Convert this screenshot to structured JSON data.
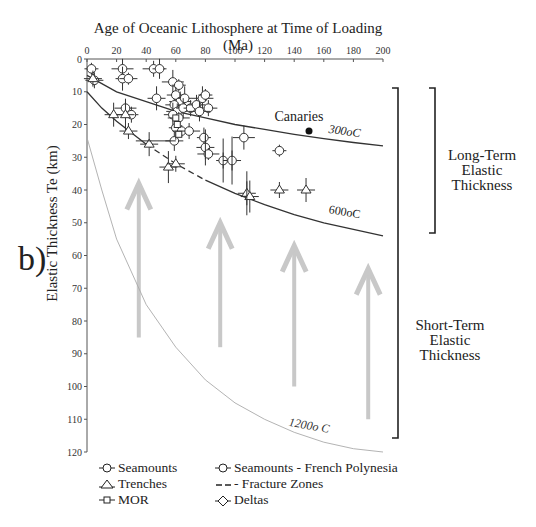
{
  "panel_label": "b)",
  "chart_data": {
    "type": "scatter",
    "title": "Age of Oceanic Lithosphere at Time of Loading (Ma)",
    "xlabel": "Age of Oceanic Lithosphere at Time of Loading (Ma)",
    "ylabel": "Elastic Thickness Te (km)",
    "xlim": [
      0,
      200
    ],
    "ylim": [
      0,
      120
    ],
    "y_inverted": true,
    "x_ticks": [
      0,
      20,
      40,
      60,
      80,
      100,
      120,
      140,
      160,
      180,
      200
    ],
    "y_ticks": [
      0,
      10,
      20,
      30,
      40,
      50,
      60,
      70,
      80,
      90,
      100,
      110,
      120
    ],
    "x_axis_position": "top",
    "grid": false,
    "isotherms": [
      {
        "label": "300oC",
        "points": [
          [
            0,
            5
          ],
          [
            20,
            10
          ],
          [
            40,
            13
          ],
          [
            60,
            16
          ],
          [
            80,
            18
          ],
          [
            100,
            20
          ],
          [
            120,
            21.5
          ],
          [
            140,
            23
          ],
          [
            160,
            24.3
          ],
          [
            180,
            25.5
          ],
          [
            200,
            26.5
          ]
        ]
      },
      {
        "label": "600oC",
        "points": [
          [
            0,
            10
          ],
          [
            10,
            15
          ],
          [
            20,
            19
          ],
          [
            40,
            26
          ],
          [
            60,
            32
          ],
          [
            80,
            37
          ],
          [
            100,
            41
          ],
          [
            120,
            44.5
          ],
          [
            140,
            47.5
          ],
          [
            160,
            50
          ],
          [
            180,
            52
          ],
          [
            200,
            54
          ]
        ]
      },
      {
        "label": "1200oC",
        "points": [
          [
            0,
            24
          ],
          [
            10,
            40
          ],
          [
            20,
            55
          ],
          [
            40,
            75
          ],
          [
            60,
            88
          ],
          [
            80,
            98
          ],
          [
            100,
            105
          ],
          [
            120,
            110
          ],
          [
            140,
            114
          ],
          [
            160,
            117
          ],
          [
            180,
            119
          ],
          [
            200,
            120
          ]
        ]
      }
    ],
    "series": [
      {
        "name": "Seamounts",
        "marker": "circle",
        "points": [
          {
            "x": 3,
            "y": 3
          },
          {
            "x": 5,
            "y": 6.5
          },
          {
            "x": 24,
            "y": 3
          },
          {
            "x": 24,
            "y": 6
          },
          {
            "x": 28,
            "y": 6
          },
          {
            "x": 45,
            "y": 3
          },
          {
            "x": 49,
            "y": 3
          },
          {
            "x": 47,
            "y": 12
          },
          {
            "x": 26,
            "y": 15
          },
          {
            "x": 30,
            "y": 17
          },
          {
            "x": 59,
            "y": 25
          },
          {
            "x": 58,
            "y": 7
          },
          {
            "x": 62,
            "y": 8
          },
          {
            "x": 60,
            "y": 11
          },
          {
            "x": 63,
            "y": 13
          },
          {
            "x": 66,
            "y": 12
          },
          {
            "x": 59,
            "y": 14
          },
          {
            "x": 61,
            "y": 16
          },
          {
            "x": 65,
            "y": 15
          },
          {
            "x": 58,
            "y": 17
          },
          {
            "x": 62,
            "y": 18
          },
          {
            "x": 70,
            "y": 15
          },
          {
            "x": 74,
            "y": 14
          },
          {
            "x": 78,
            "y": 12
          },
          {
            "x": 80,
            "y": 11
          },
          {
            "x": 82,
            "y": 15
          },
          {
            "x": 76,
            "y": 16
          },
          {
            "x": 60,
            "y": 21
          },
          {
            "x": 64,
            "y": 22
          },
          {
            "x": 69,
            "y": 22
          },
          {
            "x": 79,
            "y": 24
          },
          {
            "x": 80,
            "y": 27
          },
          {
            "x": 82,
            "y": 29
          },
          {
            "x": 92,
            "y": 31
          },
          {
            "x": 98,
            "y": 31
          },
          {
            "x": 106,
            "y": 24
          },
          {
            "x": 130,
            "y": 28
          }
        ]
      },
      {
        "name": "Trenches",
        "marker": "triangle",
        "points": [
          {
            "x": 4,
            "y": 6
          },
          {
            "x": 18,
            "y": 17
          },
          {
            "x": 26,
            "y": 17
          },
          {
            "x": 28,
            "y": 22
          },
          {
            "x": 42,
            "y": 26
          },
          {
            "x": 55,
            "y": 33
          },
          {
            "x": 60,
            "y": 32
          },
          {
            "x": 108,
            "y": 41
          },
          {
            "x": 110,
            "y": 42
          },
          {
            "x": 130,
            "y": 40
          },
          {
            "x": 148,
            "y": 40
          }
        ]
      },
      {
        "name": "MOR",
        "marker": "square",
        "points": [
          {
            "x": 60,
            "y": 18
          },
          {
            "x": 61,
            "y": 20
          },
          {
            "x": 62,
            "y": 23
          }
        ]
      },
      {
        "name": "Seamounts - French Polynesia",
        "marker": "circle",
        "points": []
      },
      {
        "name": "Fracture Zones",
        "marker": "dash",
        "points": []
      },
      {
        "name": "Deltas",
        "marker": "diamond",
        "points": []
      },
      {
        "name": "Canaries",
        "marker": "filled-circle",
        "points": [
          {
            "x": 150,
            "y": 22
          }
        ]
      }
    ],
    "annotations": [
      {
        "text": "Canaries",
        "x": 150,
        "y": 22
      },
      {
        "text": "Long-Term Elastic Thickness",
        "bracket_y": [
          0,
          50
        ]
      },
      {
        "text": "Short-Term Elastic Thickness",
        "bracket_y": [
          0,
          115
        ]
      }
    ],
    "arrows": [
      {
        "x": 35,
        "y_from": 85,
        "y_to": 38
      },
      {
        "x": 90,
        "y_from": 88,
        "y_to": 50
      },
      {
        "x": 140,
        "y_from": 100,
        "y_to": 57
      },
      {
        "x": 190,
        "y_from": 110,
        "y_to": 64
      }
    ],
    "legend": [
      {
        "marker": "circle",
        "label": "Seamounts"
      },
      {
        "marker": "triangle",
        "label": "Trenches"
      },
      {
        "marker": "square",
        "label": "MOR"
      },
      {
        "marker": "circle",
        "label": "Seamounts - French Polynesia"
      },
      {
        "marker": "dash",
        "label": "- Fracture Zones"
      },
      {
        "marker": "diamond",
        "label": "Deltas"
      }
    ]
  },
  "labels": {
    "canaries": "Canaries",
    "iso300": "300oC",
    "iso600": "600oC",
    "iso1200": "1200o C",
    "long_term": [
      "Long-Term",
      "Elastic",
      "Thickness"
    ],
    "short_term": [
      "Short-Term",
      "Elastic",
      "Thickness"
    ]
  }
}
